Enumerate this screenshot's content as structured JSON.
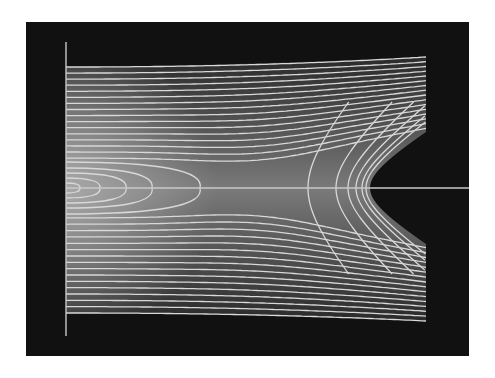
{
  "figure": {
    "colors": {
      "background": "#ffffff",
      "panel": "#111111",
      "contour_line": "#d8d8d8",
      "axis_line": "#c8c8c8",
      "fill_low": "#2a2a2a",
      "fill_high": "#a8a8a8"
    }
  },
  "chart_data": {
    "type": "contour",
    "title": "",
    "xlabel": "",
    "ylabel": "",
    "grid": false,
    "legend": null,
    "panel_px": {
      "x0": 26,
      "y0": 22,
      "x1": 469,
      "y1": 356
    },
    "plot_region_px": {
      "x0": 66,
      "x1": 426,
      "y_top_left": 67,
      "y_top_right": 57,
      "y_bottom_left": 313,
      "y_bottom_right": 321
    },
    "axes_px": {
      "vertical": {
        "x": 66,
        "y0": 42,
        "y1": 336
      },
      "horizontal": {
        "y": 188,
        "x0": 66,
        "x1": 469
      }
    },
    "features": {
      "well_center_px": [
        66,
        188
      ],
      "saddle_point_px": [
        262,
        188
      ],
      "electrode_vertex_px": [
        370,
        188
      ],
      "electrode_tips_px": [
        [
          426,
          132
        ],
        [
          426,
          241
        ]
      ]
    },
    "contour_count_per_half": 16,
    "closed_well_contours": 5
  }
}
